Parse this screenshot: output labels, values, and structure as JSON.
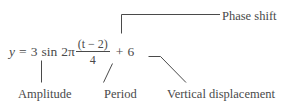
{
  "figure": {
    "name": "annotated-sinusoidal-equation",
    "background_color": "#ffffff",
    "ink_color": "#4a4a4a"
  },
  "equation": {
    "lhs_variable": "y",
    "equals": "=",
    "amplitude_coefficient": "3",
    "function": "sin",
    "angular_factor": "2π",
    "fraction": {
      "numerator": "(t − 2)",
      "denominator": "4"
    },
    "plus_sign": "+",
    "vertical_shift": "6",
    "full_text": "y = 3 sin 2π(t − 2)/4 + 6"
  },
  "annotations": {
    "phase_shift": {
      "label": "Phase shift",
      "points_to": "numerator"
    },
    "amplitude": {
      "label": "Amplitude",
      "points_to": "amplitude-coefficient"
    },
    "period": {
      "label": "Period",
      "points_to": "denominator"
    },
    "vertical_displacement": {
      "label": "Vertical displacement",
      "points_to": "vertical-shift"
    }
  }
}
